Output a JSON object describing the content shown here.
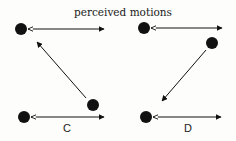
{
  "title": "perceived motions",
  "panels": [
    {
      "label": "C"
    },
    {
      "label": "D"
    }
  ],
  "colors": {
    "ink": "#111111",
    "background": "#fdfdfb"
  }
}
